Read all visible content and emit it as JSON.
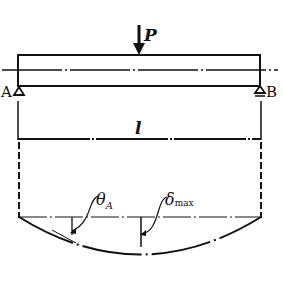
{
  "diagram": {
    "type": "simply-supported beam with central point load and deflection curve",
    "load": {
      "label": "P",
      "position": "midspan"
    },
    "supports": {
      "left": {
        "label": "A",
        "type": "pin"
      },
      "right": {
        "label": "B",
        "type": "roller"
      }
    },
    "span": {
      "label": "l"
    },
    "deflection": {
      "slope_label": "θ",
      "slope_subscript": "A",
      "max_deflection_label": "δ",
      "max_deflection_subscript": "max"
    },
    "colors": {
      "line": "#111111",
      "background": "#ffffff"
    }
  }
}
